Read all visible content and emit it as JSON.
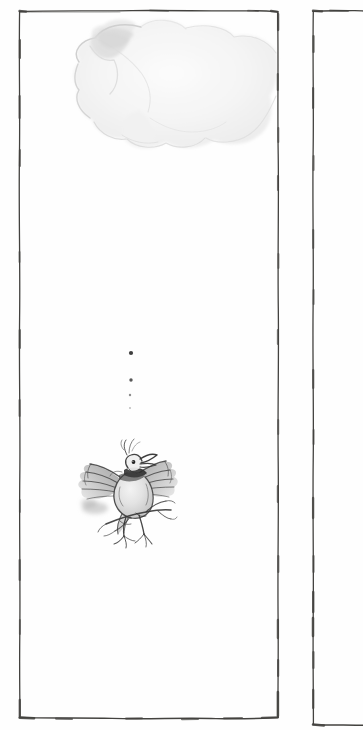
{
  "page": {
    "kind": "scanned-book-illustration-page",
    "width": 363,
    "height": 730,
    "paper_color": "#fefefe",
    "ink_color": "#3a3a3a",
    "wash_color": "#e9e9e9",
    "description": "Hand-drawn ink and wash illustration: a small bird with spread wings perched on a bare branch, beneath a pale grey cloud, with four descending dots between the cloud and the bird.",
    "visible_text": "",
    "caption": "",
    "page_number": ""
  },
  "panels": {
    "main": {
      "name": "Main illustration panel",
      "left": 19,
      "top": 11,
      "right": 278,
      "bottom": 717,
      "stroke": "#43423f",
      "stroke_width": 1.4,
      "style": "hand-drawn wavering rectangle"
    },
    "secondary": {
      "name": "Facing page panel edge",
      "left": 313,
      "top": 11,
      "right": 363,
      "bottom": 725,
      "stroke": "#43423f",
      "stroke_width": 1.4,
      "style": "hand-drawn vertical rule with top and bottom returns, cropped at page edge"
    }
  },
  "artwork": {
    "cloud": {
      "name": "cloud",
      "type": "grey-wash-blob",
      "bbox": [
        64,
        18,
        278,
        160
      ],
      "fill": "#f1f1f1",
      "edge": "#d6d6d6",
      "darkest_edge": "#c9c9c9",
      "note": "pale grey watercolour wash, darker along upper-left contour, open to the right panel border"
    },
    "dots": {
      "name": "falling dots",
      "count": 4,
      "color": "#2e2e2e",
      "points": [
        {
          "x": 131,
          "y": 353,
          "r": 2.1,
          "opacity": 0.92
        },
        {
          "x": 131,
          "y": 380,
          "r": 1.7,
          "opacity": 0.8
        },
        {
          "x": 130,
          "y": 395,
          "r": 1.2,
          "opacity": 0.55
        },
        {
          "x": 130,
          "y": 408,
          "r": 0.9,
          "opacity": 0.35
        }
      ],
      "note": "four ink dots descending in a near-vertical line, shrinking and fading downward"
    },
    "bird": {
      "name": "bird with spread wings on branch",
      "bbox": [
        80,
        450,
        172,
        548
      ],
      "ink": "#333333",
      "body_wash": "#cfcfcf",
      "breast_highlight": "#ededed",
      "wing_wash": "#b9b9b9",
      "parts": [
        "head with open beak",
        "eye",
        "crest tuft",
        "left spread wing",
        "right spread wing",
        "tail",
        "two legs with claws",
        "bare forked branch"
      ]
    }
  }
}
